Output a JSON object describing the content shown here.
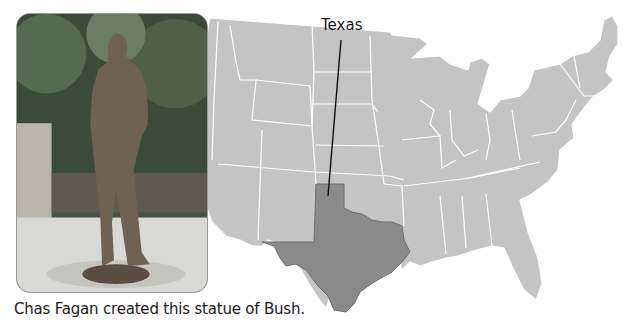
{
  "figure": {
    "caption": "Chas Fagan created this statue of Bush.",
    "photo": {
      "subject": "Bronze statue of George H. W. Bush standing in a park"
    },
    "map": {
      "title": "United States map",
      "highlighted_state": "Texas",
      "label": "Texas",
      "colors": {
        "states": "#c4c4c4",
        "highlight": "#8a8a8a",
        "borders": "#ffffff",
        "leader_line": "#111111"
      }
    }
  }
}
